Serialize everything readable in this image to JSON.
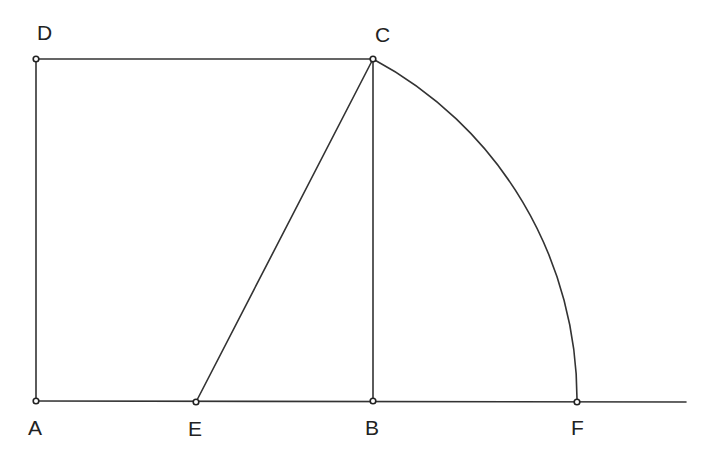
{
  "diagram": {
    "type": "geometric-construction",
    "points": {
      "A": {
        "label": "A",
        "x": 36,
        "y": 401,
        "lx": 28,
        "ly": 435
      },
      "B": {
        "label": "B",
        "x": 373,
        "y": 401,
        "lx": 365,
        "ly": 435
      },
      "C": {
        "label": "C",
        "x": 373,
        "y": 59,
        "lx": 375,
        "ly": 42
      },
      "D": {
        "label": "D",
        "x": 36,
        "y": 59,
        "lx": 37,
        "ly": 40
      },
      "E": {
        "label": "E",
        "x": 196,
        "y": 402,
        "lx": 188,
        "ly": 436
      },
      "F": {
        "label": "F",
        "x": 577,
        "y": 402,
        "lx": 571,
        "ly": 435
      }
    },
    "segments": [
      {
        "from": "A",
        "to": "D",
        "name": "segment-ad"
      },
      {
        "from": "D",
        "to": "C",
        "name": "segment-dc"
      },
      {
        "from": "C",
        "to": "B",
        "name": "segment-cb"
      },
      {
        "from": "E",
        "to": "C",
        "name": "segment-ec"
      }
    ],
    "baseline": {
      "x1": 36,
      "y1": 401,
      "x2": 686,
      "y2": 402
    },
    "arc": {
      "center": "E",
      "from": "C",
      "to": "F"
    },
    "colors": {
      "stroke": "#333333",
      "text": "#222222",
      "background": "#ffffff"
    }
  }
}
